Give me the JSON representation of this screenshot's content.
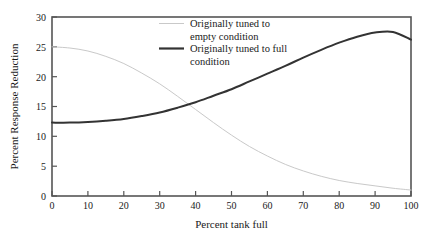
{
  "chart_data": {
    "type": "line",
    "title": "",
    "xlabel": "Percent tank full",
    "ylabel": "Percent Response Reduction",
    "xlim": [
      0,
      100
    ],
    "ylim": [
      0,
      30
    ],
    "xticks": [
      0,
      10,
      20,
      30,
      40,
      50,
      60,
      70,
      80,
      90,
      100
    ],
    "yticks": [
      0,
      5,
      10,
      15,
      20,
      25,
      30
    ],
    "grid": false,
    "legend_position": "top-right-inside",
    "frame_color": "#555555",
    "x": [
      0,
      5,
      10,
      15,
      20,
      25,
      30,
      35,
      40,
      45,
      50,
      55,
      60,
      65,
      70,
      75,
      80,
      85,
      90,
      95,
      100
    ],
    "series": [
      {
        "name": "Originally tuned to empty condition",
        "color": "#c9c9c9",
        "line_width": 1,
        "values": [
          25.0,
          24.8,
          24.3,
          23.4,
          22.2,
          20.6,
          18.8,
          16.7,
          14.5,
          12.3,
          10.2,
          8.3,
          6.7,
          5.3,
          4.2,
          3.3,
          2.6,
          2.1,
          1.7,
          1.3,
          1.0
        ]
      },
      {
        "name": "Originally tuned to full condition",
        "color": "#333333",
        "line_width": 2,
        "values": [
          12.3,
          12.3,
          12.4,
          12.6,
          12.9,
          13.4,
          14.0,
          14.8,
          15.7,
          16.8,
          17.9,
          19.2,
          20.5,
          21.8,
          23.2,
          24.5,
          25.7,
          26.7,
          27.4,
          27.5,
          26.2
        ]
      }
    ],
    "legend": [
      {
        "swatch": "#c9c9c9",
        "line1": "Originally tuned to",
        "line2": "empty condition"
      },
      {
        "swatch": "#333333",
        "line1": "Originally tuned to full",
        "line2": "condition"
      }
    ]
  }
}
